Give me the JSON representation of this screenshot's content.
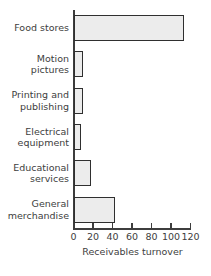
{
  "chart_data": {
    "type": "bar",
    "orientation": "horizontal",
    "title": "",
    "subtitle": "",
    "xlabel": "Receivables turnover",
    "ylabel": "",
    "categories": [
      "Food stores",
      "Motion pictures",
      "Printing and publishing",
      "Electrical equipment",
      "Educational services",
      "General merchandise"
    ],
    "category_lines": [
      [
        "Food stores"
      ],
      [
        "Motion",
        "pictures"
      ],
      [
        "Printing and",
        "publishing"
      ],
      [
        "Electrical",
        "equipment"
      ],
      [
        "Educational",
        "services"
      ],
      [
        "General",
        "merchandise"
      ]
    ],
    "values": [
      113,
      9,
      9,
      7,
      17,
      42
    ],
    "xlim": [
      0,
      120
    ],
    "xticks": [
      0,
      20,
      40,
      60,
      80,
      100,
      120
    ],
    "xtick_labels": [
      "0",
      "20",
      "40",
      "60",
      "80",
      "100",
      "120"
    ],
    "grid": false,
    "legend": false,
    "bar_fill_color": "#ececec",
    "bar_edge_color": "#2f2f2f",
    "axis_color": "#3d3d3d",
    "text_color": "#404040",
    "background_color": "#ffffff"
  }
}
